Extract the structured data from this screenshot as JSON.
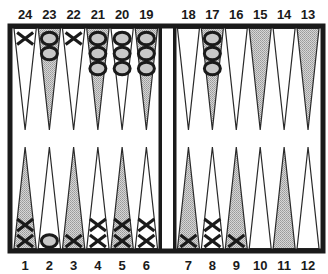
{
  "board": {
    "colors": {
      "frame": "#1a1a1a",
      "shaded_point": "#bdbdbd",
      "plain_point": "#ffffff",
      "checker_o_fill": "#c8c8c8",
      "checker_stroke": "#1a1a1a"
    },
    "top_points": [
      {
        "number": "24",
        "shaded": false,
        "checkers": {
          "type": "X",
          "count": 1
        }
      },
      {
        "number": "23",
        "shaded": true,
        "checkers": {
          "type": "O",
          "count": 2
        }
      },
      {
        "number": "22",
        "shaded": false,
        "checkers": {
          "type": "X",
          "count": 1
        }
      },
      {
        "number": "21",
        "shaded": true,
        "checkers": {
          "type": "O",
          "count": 3
        }
      },
      {
        "number": "20",
        "shaded": false,
        "checkers": {
          "type": "O",
          "count": 3
        }
      },
      {
        "number": "19",
        "shaded": true,
        "checkers": {
          "type": "O",
          "count": 3
        }
      },
      {
        "number": "18",
        "shaded": false,
        "checkers": {
          "type": "",
          "count": 0
        }
      },
      {
        "number": "17",
        "shaded": true,
        "checkers": {
          "type": "O",
          "count": 3
        }
      },
      {
        "number": "16",
        "shaded": false,
        "checkers": {
          "type": "",
          "count": 0
        }
      },
      {
        "number": "15",
        "shaded": true,
        "checkers": {
          "type": "",
          "count": 0
        }
      },
      {
        "number": "14",
        "shaded": false,
        "checkers": {
          "type": "",
          "count": 0
        }
      },
      {
        "number": "13",
        "shaded": true,
        "checkers": {
          "type": "",
          "count": 0
        }
      }
    ],
    "bottom_points": [
      {
        "number": "1",
        "shaded": true,
        "checkers": {
          "type": "X",
          "count": 2
        }
      },
      {
        "number": "2",
        "shaded": false,
        "checkers": {
          "type": "O",
          "count": 1
        }
      },
      {
        "number": "3",
        "shaded": true,
        "checkers": {
          "type": "X",
          "count": 1
        }
      },
      {
        "number": "4",
        "shaded": false,
        "checkers": {
          "type": "X",
          "count": 2
        }
      },
      {
        "number": "5",
        "shaded": true,
        "checkers": {
          "type": "X",
          "count": 2
        }
      },
      {
        "number": "6",
        "shaded": false,
        "checkers": {
          "type": "X",
          "count": 2
        }
      },
      {
        "number": "7",
        "shaded": true,
        "checkers": {
          "type": "X",
          "count": 1
        }
      },
      {
        "number": "8",
        "shaded": false,
        "checkers": {
          "type": "X",
          "count": 2
        }
      },
      {
        "number": "9",
        "shaded": true,
        "checkers": {
          "type": "X",
          "count": 1
        }
      },
      {
        "number": "10",
        "shaded": false,
        "checkers": {
          "type": "",
          "count": 0
        }
      },
      {
        "number": "11",
        "shaded": true,
        "checkers": {
          "type": "",
          "count": 0
        }
      },
      {
        "number": "12",
        "shaded": false,
        "checkers": {
          "type": "",
          "count": 0
        }
      }
    ]
  }
}
